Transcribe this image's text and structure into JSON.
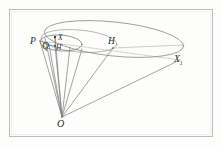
{
  "figure": {
    "background_color": "#fdfdfc",
    "frame": {
      "name": "page-border",
      "color": "#b9b9b9",
      "x": 9,
      "y": 9,
      "width": 204,
      "height": 128
    },
    "stroke_color": "#7a7a7a",
    "stroke_color_dark": "#4a4a4a",
    "label_color": "#2b2b2b",
    "labels": [
      {
        "id": "P",
        "text": "P",
        "x": 30,
        "y": 44,
        "size": 9.5,
        "sub": ""
      },
      {
        "id": "Q",
        "text": "Q",
        "x": 42,
        "y": 49,
        "size": 9.5,
        "sub": ""
      },
      {
        "id": "X",
        "text": "X",
        "x": 58,
        "y": 40,
        "size": 7.5,
        "sub": ""
      },
      {
        "id": "Hp",
        "text": "H",
        "x": 56,
        "y": 50,
        "size": 7.5,
        "sub": "'"
      },
      {
        "id": "H",
        "text": "H",
        "x": 108,
        "y": 44,
        "size": 9.5,
        "sub": ""
      },
      {
        "id": "X1",
        "text": "X",
        "x": 174,
        "y": 62,
        "size": 9.5,
        "sub": "1"
      },
      {
        "id": "O",
        "text": "O",
        "x": 57,
        "y": 127,
        "size": 10,
        "sub": ""
      }
    ],
    "points": [
      {
        "id": "O",
        "x": 62,
        "y": 117
      },
      {
        "id": "P",
        "x": 40,
        "y": 41
      },
      {
        "id": "Q",
        "x": 49,
        "y": 45
      },
      {
        "id": "X",
        "x": 55,
        "y": 37
      },
      {
        "id": "Hp",
        "x": 55,
        "y": 46
      },
      {
        "id": "H",
        "x": 113,
        "y": 48
      },
      {
        "id": "X1",
        "x": 180,
        "y": 60
      }
    ],
    "ellipses": [
      {
        "name": "base-ellipse-large",
        "cx": 114,
        "cy": 39,
        "rx": 70,
        "ry": 17,
        "rotate": 6
      },
      {
        "name": "inner-ellipse-small",
        "cx": 61,
        "cy": 43,
        "rx": 21,
        "ry": 8,
        "rotate": 4
      },
      {
        "name": "mid-ellipse",
        "cx": 79,
        "cy": 41,
        "rx": 38,
        "ry": 11,
        "rotate": 5
      }
    ],
    "generators": [
      {
        "name": "generator-O-P",
        "from": "O",
        "to": "P"
      },
      {
        "name": "generator-O-Q",
        "from": "O",
        "to": "Q"
      },
      {
        "name": "generator-O-X",
        "from": "O",
        "to": "X"
      },
      {
        "name": "generator-O-Hp",
        "from": "O",
        "to": "Hp"
      },
      {
        "name": "generator-O-H",
        "from": "O",
        "to": "H"
      },
      {
        "name": "generator-O-X1",
        "from": "O",
        "to": "X1"
      }
    ],
    "axis_line": {
      "name": "axis-P-X1",
      "from": "P",
      "to": "X1"
    }
  }
}
